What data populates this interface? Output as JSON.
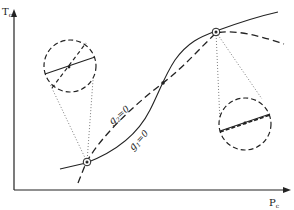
{
  "axes": {
    "y_label_main": "T",
    "y_label_sub": "c",
    "x_label_main": "P",
    "x_label_sub": "c"
  },
  "curves": {
    "g1": {
      "label_main": "g",
      "label_sub": "1",
      "label_rest": "=0",
      "style": "solid"
    },
    "g2": {
      "label_main": "g",
      "label_sub": "2",
      "label_rest": "=0",
      "style": "dashed"
    }
  },
  "points": [
    {
      "name": "lower-left-singular-point",
      "style": "circled"
    },
    {
      "name": "middle-crossing-point",
      "style": "dot"
    },
    {
      "name": "upper-right-singular-point",
      "style": "circled"
    }
  ],
  "magnifiers": [
    {
      "name": "left-magnifier",
      "content": "curves crossing transversally"
    },
    {
      "name": "right-magnifier",
      "content": "curves tangent / overlapping"
    }
  ],
  "colors": {
    "ink": "#222222",
    "background": "#ffffff"
  }
}
